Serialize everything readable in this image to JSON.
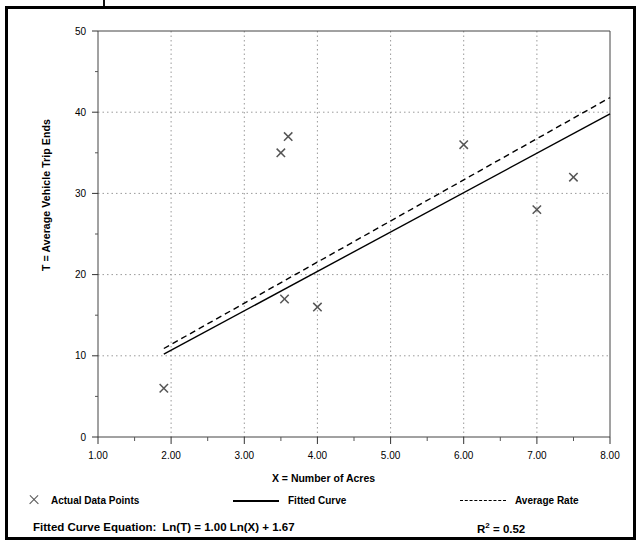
{
  "chart_data": {
    "type": "scatter",
    "title": "",
    "xlabel": "X = Number of Acres",
    "ylabel": "T = Average Vehicle Trip Ends",
    "xlim": [
      1.0,
      8.0
    ],
    "ylim": [
      0,
      50
    ],
    "xticks": [
      "1.00",
      "2.00",
      "3.00",
      "4.00",
      "5.00",
      "6.00",
      "7.00",
      "8.00"
    ],
    "yticks": [
      "0",
      "10",
      "20",
      "30",
      "40",
      "50"
    ],
    "grid": "dotted",
    "legend_position": "below-axes",
    "series": [
      {
        "name": "Actual Data Points",
        "type": "scatter",
        "marker": "x",
        "color": "#555555",
        "points": [
          {
            "x": 1.9,
            "y": 6
          },
          {
            "x": 3.5,
            "y": 35
          },
          {
            "x": 3.6,
            "y": 37
          },
          {
            "x": 3.55,
            "y": 17
          },
          {
            "x": 4.0,
            "y": 16
          },
          {
            "x": 6.0,
            "y": 36
          },
          {
            "x": 7.0,
            "y": 28
          },
          {
            "x": 7.5,
            "y": 32
          }
        ]
      },
      {
        "name": "Fitted Curve",
        "type": "line",
        "style": "solid",
        "color": "#000000",
        "points": [
          {
            "x": 1.9,
            "y": 10.2
          },
          {
            "x": 8.0,
            "y": 39.8
          }
        ]
      },
      {
        "name": "Average Rate",
        "type": "line",
        "style": "dashed",
        "color": "#000000",
        "points": [
          {
            "x": 1.9,
            "y": 10.9
          },
          {
            "x": 8.0,
            "y": 41.8
          }
        ]
      }
    ]
  },
  "legend": {
    "items": [
      {
        "label": "Actual Data Points",
        "marker": "x-marker"
      },
      {
        "label": "Fitted Curve",
        "marker": "solid-line"
      },
      {
        "label": "Average Rate",
        "marker": "dashed-line"
      }
    ]
  },
  "footer": {
    "equation_label": "Fitted Curve Equation:",
    "equation_value": "Ln(T) = 1.00 Ln(X) + 1.67",
    "rsq_symbol": "R",
    "rsq_exponent": "2",
    "rsq_value": "= 0.52"
  }
}
